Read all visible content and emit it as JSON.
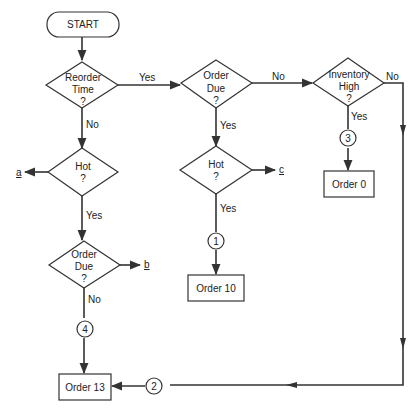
{
  "diagram": {
    "type": "flowchart",
    "nodes": {
      "start": {
        "label": "START"
      },
      "reorder_time": {
        "lines": [
          "Reorder",
          "Time",
          "?"
        ]
      },
      "order_due_top": {
        "lines": [
          "Order",
          "Due",
          "?"
        ]
      },
      "inventory_high": {
        "lines": [
          "Inventory",
          "High",
          "?"
        ]
      },
      "hot_left": {
        "lines": [
          "Hot",
          "?"
        ]
      },
      "hot_mid": {
        "lines": [
          "Hot",
          "?"
        ]
      },
      "order_due_left": {
        "lines": [
          "Order",
          "Due",
          "?"
        ]
      },
      "order_0": {
        "label": "Order 0"
      },
      "order_10": {
        "label": "Order 10"
      },
      "order_13": {
        "label": "Order 13"
      }
    },
    "connectors": {
      "c1": "1",
      "c2": "2",
      "c3": "3",
      "c4": "4"
    },
    "exits": {
      "a": "a",
      "b": "b",
      "c": "c"
    },
    "edge_labels": {
      "reorder_yes": "Yes",
      "reorder_no": "No",
      "order_due_top_no": "No",
      "order_due_top_yes": "Yes",
      "inventory_no": "No",
      "inventory_yes": "Yes",
      "hot_left_yes": "Yes",
      "hot_mid_yes": "Yes",
      "order_due_left_no": "No"
    },
    "colors": {
      "line": "#333333",
      "background": "#ffffff"
    }
  }
}
